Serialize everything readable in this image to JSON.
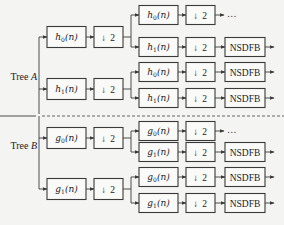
{
  "diagram": {
    "type": "filter-bank-tree",
    "trees": [
      {
        "label": "Tree ",
        "label_var": "A",
        "stage1": [
          {
            "filter": "h",
            "sub": "0",
            "arg": "(n)",
            "down": "2",
            "stage2": [
              {
                "filter": "h",
                "sub": "0",
                "arg": "(n)",
                "down": "2",
                "out": "…"
              },
              {
                "filter": "h",
                "sub": "1",
                "arg": "(n)",
                "down": "2",
                "out": "NSDFB"
              }
            ]
          },
          {
            "filter": "h",
            "sub": "1",
            "arg": "(n)",
            "down": "2",
            "stage2": [
              {
                "filter": "h",
                "sub": "0",
                "arg": "(n)",
                "down": "2",
                "out": "NSDFB"
              },
              {
                "filter": "h",
                "sub": "1",
                "arg": "(n)",
                "down": "2",
                "out": "NSDFB"
              }
            ]
          }
        ]
      },
      {
        "label": "Tree ",
        "label_var": "B",
        "stage1": [
          {
            "filter": "g",
            "sub": "0",
            "arg": "(n)",
            "down": "2",
            "stage2": [
              {
                "filter": "g",
                "sub": "0",
                "arg": "(n)",
                "down": "2",
                "out": "…"
              },
              {
                "filter": "g",
                "sub": "1",
                "arg": "(n)",
                "down": "2",
                "out": "NSDFB"
              }
            ]
          },
          {
            "filter": "g",
            "sub": "1",
            "arg": "(n)",
            "down": "2",
            "stage2": [
              {
                "filter": "g",
                "sub": "0",
                "arg": "(n)",
                "down": "2",
                "out": "NSDFB"
              },
              {
                "filter": "g",
                "sub": "1",
                "arg": "(n)",
                "down": "2",
                "out": "NSDFB"
              }
            ]
          }
        ]
      }
    ],
    "down_arrow": "↓",
    "colors": {
      "stroke": "#3a3a3a",
      "background": "#f4f4f2",
      "box_fill": "#fafaf8"
    }
  }
}
